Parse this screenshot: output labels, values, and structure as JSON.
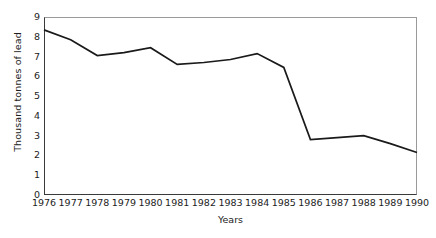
{
  "chart_data": {
    "type": "line",
    "title": "",
    "xlabel": "Years",
    "ylabel": "Thousand tonnes of lead",
    "categories": [
      "1976",
      "1977",
      "1978",
      "1979",
      "1980",
      "1981",
      "1982",
      "1983",
      "1984",
      "1985",
      "1986",
      "1987",
      "1988",
      "1989",
      "1990"
    ],
    "values": [
      8.35,
      7.85,
      7.05,
      7.2,
      7.45,
      6.6,
      6.7,
      6.85,
      7.15,
      6.45,
      2.8,
      2.9,
      3.0,
      2.6,
      2.15
    ],
    "series": [
      {
        "name": "Lead",
        "values": [
          8.35,
          7.85,
          7.05,
          7.2,
          7.45,
          6.6,
          6.7,
          6.85,
          7.15,
          6.45,
          2.8,
          2.9,
          3.0,
          2.6,
          2.15
        ]
      }
    ],
    "ylim": [
      0,
      9
    ],
    "xlim": [
      "1976",
      "1990"
    ],
    "y_ticks": [
      "0",
      "1",
      "2",
      "3",
      "4",
      "5",
      "6",
      "7",
      "8",
      "9"
    ],
    "x_ticks": [
      "1976",
      "1977",
      "1978",
      "1979",
      "1980",
      "1981",
      "1982",
      "1983",
      "1984",
      "1985",
      "1986",
      "1987",
      "1988",
      "1989",
      "1990"
    ],
    "grid": false,
    "legend": false,
    "legend_position": "none",
    "line_color": "#1a1a1a",
    "background_color": "#ffffff",
    "axis_color": "#3a3a3a",
    "frame_color": "#9a9a9a"
  }
}
